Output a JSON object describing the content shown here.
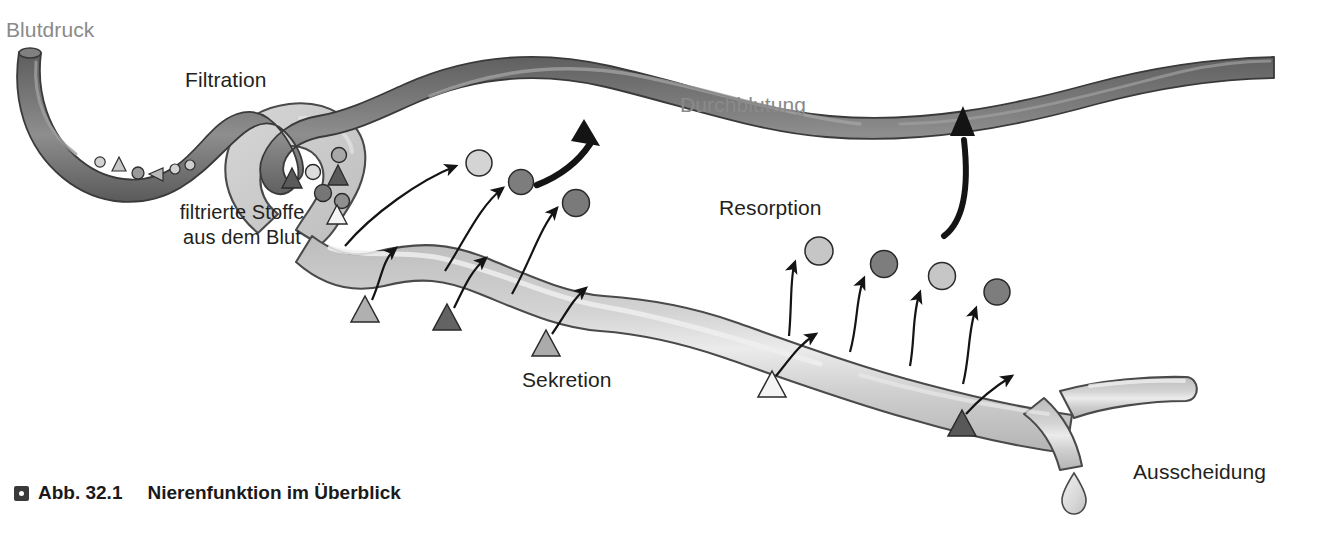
{
  "figure": {
    "background_color": "#ffffff",
    "width": 1344,
    "height": 533
  },
  "caption": {
    "marker_icon": "square-bullet-icon",
    "number_label": "Abb. 32.1",
    "title": "Nierenfunktion im Überblick"
  },
  "labels": [
    {
      "id": "blutdruck",
      "text": "Blutdruck",
      "x": 6,
      "y": 18,
      "color": "#8a8a8a",
      "size": 21,
      "align": "left"
    },
    {
      "id": "filtration",
      "text": "Filtration",
      "x": 185,
      "y": 68,
      "color": "#231f20",
      "size": 21,
      "align": "left"
    },
    {
      "id": "durchblutung",
      "text": "Durchblutung",
      "x": 680,
      "y": 93,
      "color": "#8a8a8a",
      "size": 21,
      "align": "left"
    },
    {
      "id": "resorption",
      "text": "Resorption",
      "x": 719,
      "y": 196,
      "color": "#231f20",
      "size": 21,
      "align": "left"
    },
    {
      "id": "sekretion",
      "text": "Sekretion",
      "x": 522,
      "y": 368,
      "color": "#231f20",
      "size": 21,
      "align": "left"
    },
    {
      "id": "ausscheidung",
      "text": "Ausscheidung",
      "x": 1133,
      "y": 460,
      "color": "#231f20",
      "size": 21,
      "align": "left"
    }
  ],
  "multiline_labels": [
    {
      "id": "filtrierte-stoffe",
      "lines": [
        "filtrierte Stoffe",
        "aus dem Blut"
      ],
      "x": 167,
      "y": 200,
      "color": "#231f20",
      "size": 20
    }
  ],
  "colors": {
    "vessel_fill": "#6e6e6e",
    "vessel_stroke": "#3f3f3f",
    "vessel_highlight": "#9a9a9a",
    "tubule_fill": "#c4c4c4",
    "tubule_stroke": "#4a4a4a",
    "tubule_highlight": "#ececec",
    "capsule_fill": "#cfcfcf",
    "particle_light": "#c9c9c9",
    "particle_dark": "#7b7b7b",
    "particle_outline": "#3a3a3a",
    "triangle_light": "#a8a8a8",
    "triangle_dark": "#5e5e5e",
    "triangle_white": "#f2f2f2",
    "arrow_color": "#1a1a1a",
    "drop_fill": "#dcdcdc",
    "text_dark": "#231f20",
    "text_gray": "#8a8a8a"
  },
  "diagram": {
    "type": "kidney-nephron-overview",
    "structures": [
      {
        "name": "afferent-efferent-arteriole",
        "role": "blood-vessel",
        "shade": "dark"
      },
      {
        "name": "bowman-capsule",
        "role": "filtration-capsule",
        "shade": "light"
      },
      {
        "name": "renal-tubule",
        "role": "tubule",
        "shade": "light"
      },
      {
        "name": "collecting-duct-branch",
        "role": "excretion-duct",
        "shade": "light"
      },
      {
        "name": "peritubular-capillary",
        "role": "blood-vessel",
        "shade": "dark"
      },
      {
        "name": "urine-drop",
        "role": "excretion-drop",
        "shade": "light"
      }
    ],
    "particles_in_arteriole": [
      {
        "shape": "circle",
        "fill": "light",
        "x": 100,
        "y": 163,
        "r": 5
      },
      {
        "shape": "triangle",
        "fill": "light",
        "x": 119,
        "y": 170,
        "s": 11
      },
      {
        "shape": "circle",
        "fill": "light",
        "x": 137,
        "y": 173,
        "r": 6
      },
      {
        "shape": "triangle",
        "fill": "light",
        "x": 156,
        "y": 174,
        "s": 11,
        "rotate": -100
      },
      {
        "shape": "circle",
        "fill": "light",
        "x": 174,
        "y": 169,
        "r": 5
      },
      {
        "shape": "circle",
        "fill": "light",
        "x": 189,
        "y": 166,
        "r": 5
      }
    ],
    "particles_in_capsule": [
      {
        "shape": "triangle",
        "fill": "dark",
        "x": 291,
        "y": 178,
        "s": 14,
        "rotate": -20
      },
      {
        "shape": "circle",
        "fill": "light",
        "x": 312,
        "y": 172,
        "r": 7
      },
      {
        "shape": "triangle",
        "fill": "dark",
        "x": 336,
        "y": 174,
        "s": 14,
        "rotate": 10
      },
      {
        "shape": "circle",
        "fill": "light",
        "x": 338,
        "y": 156,
        "r": 7
      },
      {
        "shape": "circle",
        "fill": "dark",
        "x": 323,
        "y": 192,
        "r": 8
      },
      {
        "shape": "circle",
        "fill": "dark",
        "x": 341,
        "y": 200,
        "r": 7
      },
      {
        "shape": "triangle",
        "fill": "white",
        "x": 336,
        "y": 214,
        "s": 14
      }
    ],
    "resorption_particles_left": [
      {
        "shape": "circle",
        "fill": "light",
        "x": 478,
        "y": 164,
        "r": 13
      },
      {
        "shape": "circle",
        "fill": "dark",
        "x": 521,
        "y": 182,
        "r": 12
      },
      {
        "shape": "circle",
        "fill": "dark",
        "x": 575,
        "y": 203,
        "r": 13
      }
    ],
    "resorption_particles_right": [
      {
        "shape": "circle",
        "fill": "light",
        "x": 818,
        "y": 252,
        "r": 14
      },
      {
        "shape": "circle",
        "fill": "dark",
        "x": 884,
        "y": 264,
        "r": 13
      },
      {
        "shape": "circle",
        "fill": "light",
        "x": 941,
        "y": 276,
        "r": 13
      },
      {
        "shape": "circle",
        "fill": "dark",
        "x": 996,
        "y": 292,
        "r": 13
      }
    ],
    "secretion_triangles": [
      {
        "fill": "light",
        "x": 365,
        "y": 312,
        "s": 22
      },
      {
        "fill": "dark",
        "x": 447,
        "y": 320,
        "s": 22
      },
      {
        "fill": "light",
        "x": 546,
        "y": 345,
        "s": 22
      },
      {
        "fill": "white",
        "x": 772,
        "y": 387,
        "s": 22
      },
      {
        "fill": "dark",
        "x": 962,
        "y": 425,
        "s": 22
      }
    ]
  }
}
